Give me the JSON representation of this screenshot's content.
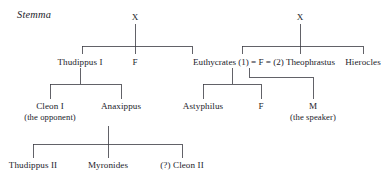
{
  "figure": {
    "title": "Stemma",
    "kind": "genealogical-stemma",
    "background_color": "#ffffff",
    "text_color": "#22222a",
    "line_color": "#3b3b42"
  },
  "generations": {
    "g1": {
      "label": "generation-1-ancestors",
      "nodes": [
        {
          "id": "x-left",
          "label": "X"
        },
        {
          "id": "x-right",
          "label": "X"
        }
      ]
    },
    "g2": {
      "label": "generation-2",
      "nodes": [
        {
          "id": "thudippus-1",
          "label": "Thudippus I"
        },
        {
          "id": "f-left",
          "label": "F"
        },
        {
          "id": "hierocles",
          "label": "Hierocles"
        }
      ],
      "marriage": {
        "id": "marriage-row",
        "husband_1": "Euthycrates",
        "order_1": "(1)",
        "eq_1": "=",
        "wife": "F",
        "eq_2": "=",
        "order_2": "(2)",
        "husband_2": "Theophrastus",
        "full_text": "Euthycrates (1) = F = (2) Theophrastus"
      }
    },
    "g3": {
      "label": "generation-3",
      "nodes": [
        {
          "id": "cleon-1",
          "label": "Cleon I",
          "gloss": "(the opponent)"
        },
        {
          "id": "anaxippus",
          "label": "Anaxippus",
          "gloss": ""
        },
        {
          "id": "astyphilus",
          "label": "Astyphilus",
          "gloss": ""
        },
        {
          "id": "f-right",
          "label": "F",
          "gloss": ""
        },
        {
          "id": "m-speaker",
          "label": "M",
          "gloss": "(the speaker)"
        }
      ]
    },
    "g4": {
      "label": "generation-4",
      "nodes": [
        {
          "id": "thudippus-2",
          "label": "Thudippus II"
        },
        {
          "id": "myronides",
          "label": "Myronides"
        },
        {
          "id": "cleon-2",
          "label": "(?) Cleon II"
        }
      ]
    }
  }
}
